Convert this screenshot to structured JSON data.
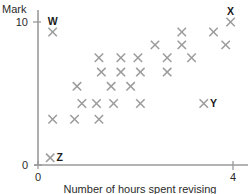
{
  "chart_data": {
    "type": "scatter",
    "title": "",
    "xlabel": "Number of hours spent revising",
    "ylabel": "Mark",
    "xlim": [
      0,
      4.35
    ],
    "ylim": [
      0,
      11.3
    ],
    "grid": false,
    "legend": null,
    "x_ticks": [
      "0",
      "4"
    ],
    "x_tick_values": [
      0,
      4
    ],
    "y_ticks": [
      "0",
      "10"
    ],
    "y_tick_values": [
      0,
      10
    ],
    "marker": "cross",
    "marker_color": "#9b9b9b",
    "axis_color": "#9a9a9a",
    "points": [
      {
        "x": 0.3,
        "y": 9.3,
        "label": "W"
      },
      {
        "x": 0.25,
        "y": 0.5,
        "label": "Z"
      },
      {
        "x": 3.95,
        "y": 10.0,
        "label": "X"
      },
      {
        "x": 3.4,
        "y": 4.3,
        "label": "Y"
      },
      {
        "x": 0.3,
        "y": 3.2,
        "label": ""
      },
      {
        "x": 0.75,
        "y": 3.2,
        "label": ""
      },
      {
        "x": 1.25,
        "y": 3.2,
        "label": ""
      },
      {
        "x": 0.9,
        "y": 4.3,
        "label": ""
      },
      {
        "x": 1.2,
        "y": 4.3,
        "label": ""
      },
      {
        "x": 1.55,
        "y": 4.3,
        "label": ""
      },
      {
        "x": 2.1,
        "y": 4.3,
        "label": ""
      },
      {
        "x": 0.8,
        "y": 5.5,
        "label": ""
      },
      {
        "x": 1.5,
        "y": 5.5,
        "label": ""
      },
      {
        "x": 1.9,
        "y": 5.5,
        "label": ""
      },
      {
        "x": 1.3,
        "y": 6.5,
        "label": ""
      },
      {
        "x": 1.7,
        "y": 6.5,
        "label": ""
      },
      {
        "x": 2.1,
        "y": 6.5,
        "label": ""
      },
      {
        "x": 2.65,
        "y": 6.5,
        "label": ""
      },
      {
        "x": 1.25,
        "y": 7.5,
        "label": ""
      },
      {
        "x": 1.7,
        "y": 7.5,
        "label": ""
      },
      {
        "x": 2.05,
        "y": 7.5,
        "label": ""
      },
      {
        "x": 2.65,
        "y": 7.5,
        "label": ""
      },
      {
        "x": 3.15,
        "y": 7.5,
        "label": ""
      },
      {
        "x": 2.4,
        "y": 8.4,
        "label": ""
      },
      {
        "x": 2.95,
        "y": 8.4,
        "label": ""
      },
      {
        "x": 3.85,
        "y": 8.4,
        "label": ""
      },
      {
        "x": 2.95,
        "y": 9.3,
        "label": ""
      },
      {
        "x": 3.6,
        "y": 9.3,
        "label": ""
      }
    ]
  }
}
